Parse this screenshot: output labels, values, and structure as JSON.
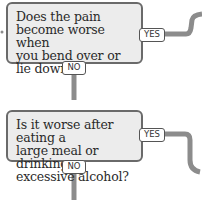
{
  "diagram": {
    "type": "flowchart",
    "nodes": [
      {
        "id": "q1",
        "question": "Does the pain become worse when you bend over or lie down?",
        "lines": [
          "Does the pain",
          "become worse when",
          "you bend over or",
          "lie down?"
        ],
        "yes_label": "YES",
        "no_label": "NO"
      },
      {
        "id": "q2",
        "question": "Is it worse after eating a large meal or drinking excessive alcohol?",
        "lines": [
          "Is it worse after eating a",
          "large meal or drinking",
          "excessive alcohol?"
        ],
        "yes_label": "YES",
        "no_label": "NO"
      }
    ],
    "edges": [
      {
        "from": "q1",
        "label": "YES",
        "to": "offscreen-right-up"
      },
      {
        "from": "q1",
        "label": "NO",
        "to": "q2"
      },
      {
        "from": "q2",
        "label": "YES",
        "to": "offscreen-right-down"
      },
      {
        "from": "q2",
        "label": "NO",
        "to": "offscreen-below"
      }
    ],
    "colors": {
      "box_fill": "#ececec",
      "box_border": "#6a6a6a",
      "connector": "#8c8c8c",
      "tag_fill": "#ffffff"
    }
  }
}
